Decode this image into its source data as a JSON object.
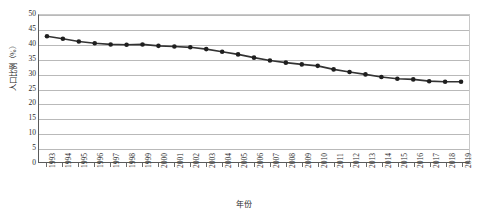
{
  "chart_data": {
    "type": "line",
    "title": "",
    "xlabel": "年份",
    "ylabel": "人口比例（%）",
    "x": [
      1993,
      1994,
      1995,
      1996,
      1997,
      1998,
      1999,
      2000,
      2001,
      2002,
      2003,
      2004,
      2005,
      2006,
      2007,
      2008,
      2009,
      2010,
      2011,
      2012,
      2013,
      2014,
      2015,
      2016,
      2017,
      2018,
      2019
    ],
    "categories": [
      "1993",
      "1994",
      "1995",
      "1996",
      "1997",
      "1998",
      "1999",
      "2000",
      "2001",
      "2002",
      "2003",
      "2004",
      "2005",
      "2006",
      "2007",
      "2008",
      "2009",
      "2010",
      "2011",
      "2012",
      "2013",
      "2014",
      "2015",
      "2016",
      "2017",
      "2018",
      "2019"
    ],
    "values": [
      42.8,
      41.9,
      41.0,
      40.4,
      40.0,
      39.9,
      40.0,
      39.5,
      39.3,
      39.0,
      38.4,
      37.5,
      36.6,
      35.5,
      34.5,
      33.8,
      33.2,
      32.7,
      31.5,
      30.6,
      29.8,
      28.9,
      28.3,
      28.1,
      27.5,
      27.3,
      27.3
    ],
    "series": [
      {
        "name": "人口比例",
        "values": [
          42.8,
          41.9,
          41.0,
          40.4,
          40.0,
          39.9,
          40.0,
          39.5,
          39.3,
          39.0,
          38.4,
          37.5,
          36.6,
          35.5,
          34.5,
          33.8,
          33.2,
          32.7,
          31.5,
          30.6,
          29.8,
          28.9,
          28.3,
          28.1,
          27.5,
          27.3,
          27.3
        ],
        "color": "#333333",
        "marker": "circle"
      }
    ],
    "ylim": [
      0,
      50
    ],
    "yticks": [
      0,
      5,
      10,
      15,
      20,
      25,
      30,
      35,
      40,
      45,
      50
    ],
    "ytick_labels": [
      "0",
      "5",
      "10",
      "15",
      "20",
      "25",
      "30",
      "35",
      "40",
      "45",
      "50"
    ],
    "grid": true,
    "grid_axis": "y",
    "legend": false,
    "legend_position": "none",
    "line_color": "#333333",
    "marker_color": "#1f1f1f",
    "gridline_color": "#b9b9b9",
    "axis_color": "#5a5a5a",
    "background": "#ffffff"
  }
}
